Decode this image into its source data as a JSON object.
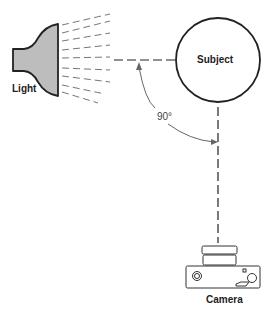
{
  "diagram": {
    "labels": {
      "light": "Light",
      "subject": "Subject",
      "camera": "Camera",
      "angle": "90°"
    },
    "colors": {
      "line": "#222222",
      "light_fill": "#bdbdbd",
      "rays": "#555555",
      "arc": "#666666"
    },
    "angle_degrees": 90
  }
}
